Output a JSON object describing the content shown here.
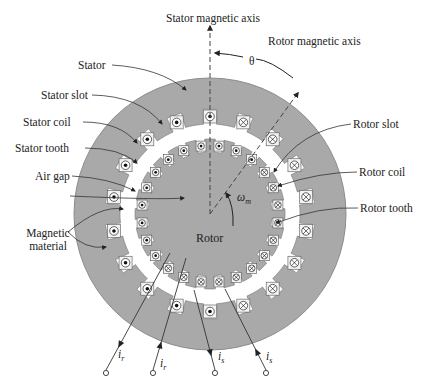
{
  "diagram": {
    "colors": {
      "iron": "#a9a9a9",
      "iron_edge": "#8c8c8c",
      "slot": "#f2f2f2",
      "line": "#333333",
      "background": "#ffffff"
    },
    "geometry": {
      "cx": 210,
      "cy": 214,
      "stator_outer_r": 136,
      "stator_inner_r": 90,
      "stator_slot_depth": 15,
      "rotor_outer_r": 75,
      "rotor_slot_depth": 13
    },
    "labels": {
      "stator_axis": "Stator magnetic axis",
      "rotor_axis": "Rotor magnetic axis",
      "theta": "θ",
      "stator": "Stator",
      "stator_slot": "Stator slot",
      "stator_coil": "Stator coil",
      "stator_tooth": "Stator tooth",
      "air_gap": "Air gap",
      "magnetic_material": "Magnetic\nmaterial",
      "magnetic_material_line1": "Magnetic",
      "magnetic_material_line2": "material",
      "rotor_slot": "Rotor slot",
      "rotor_coil": "Rotor coil",
      "rotor_tooth": "Rotor tooth",
      "rotor": "Rotor",
      "omega": "ω",
      "omega_sub": "m"
    },
    "terminals": [
      {
        "label": "i",
        "sub": "r",
        "x": 105,
        "direction": "out"
      },
      {
        "label": "i",
        "sub": "r",
        "x": 153,
        "direction": "in"
      },
      {
        "label": "i",
        "sub": "s",
        "x": 215,
        "direction": "out"
      },
      {
        "label": "i",
        "sub": "s",
        "x": 267,
        "direction": "in"
      }
    ],
    "stator_conductors": {
      "dot_side": "left",
      "cross_side": "right",
      "count": 18
    },
    "rotor_conductors": {
      "dot_side": "upper-left",
      "cross_side": "lower-right",
      "count": 24
    }
  }
}
